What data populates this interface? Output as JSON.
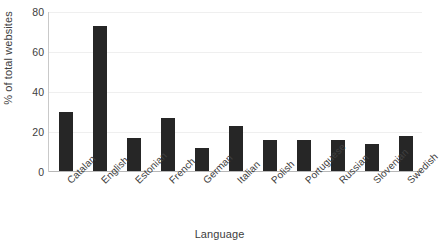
{
  "chart_data": {
    "type": "bar",
    "title": "",
    "xlabel": "Language",
    "ylabel": "% of total websites",
    "categories": [
      "Catalan",
      "English",
      "Estonian",
      "French",
      "German",
      "Italian",
      "Polish",
      "Portuguese",
      "Russian",
      "Slovenian",
      "Swedish"
    ],
    "values": [
      30,
      73,
      17,
      27,
      12,
      23,
      16,
      16,
      16,
      14,
      18
    ],
    "ylim": [
      0,
      80
    ],
    "yticks": [
      0,
      20,
      40,
      60,
      80
    ],
    "ytick_labels": [
      "0",
      "20",
      "40",
      "60",
      "80"
    ],
    "grid": true,
    "grid_axis": "y",
    "legend": false,
    "bar_color": "#262626",
    "grid_color": "#efefef",
    "axis_color": "#b7b7b7",
    "text_color": "#404040",
    "xtick_rotation": -45
  }
}
